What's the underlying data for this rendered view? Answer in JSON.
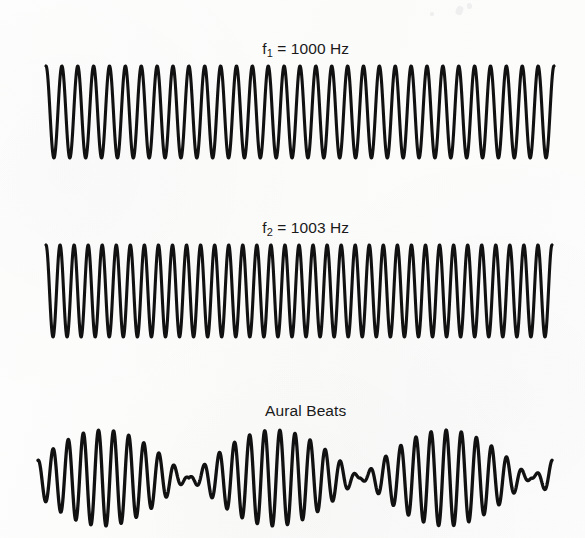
{
  "figure": {
    "title": "Aural Beats",
    "background_color": "#fcfcfb",
    "ink_color": "#111111",
    "width": 585,
    "height": 538
  },
  "panels": [
    {
      "id": "tone-1",
      "label_prefix": "f",
      "label_subscript": "1",
      "label_rest": " = 1000 Hz",
      "label_text": "f1 = 1000 Hz",
      "frequency_hz": 1000,
      "kind": "pure-tone"
    },
    {
      "id": "tone-2",
      "label_prefix": "f",
      "label_subscript": "2",
      "label_rest": " = 1003 Hz",
      "label_text": "f2 = 1003 Hz",
      "frequency_hz": 1003,
      "kind": "pure-tone"
    },
    {
      "id": "beats",
      "label_prefix": "",
      "label_subscript": "",
      "label_rest": "Aural Beats",
      "label_text": "Aural Beats",
      "frequency_hz": 3,
      "kind": "amplitude-modulated"
    }
  ],
  "chart_data": {
    "type": "line",
    "title": "Aural Beats",
    "xlabel": "",
    "ylabel": "",
    "grid": false,
    "legend": "none",
    "series": [
      {
        "name": "f1 = 1000 Hz",
        "waveform": "sine",
        "frequency_hz": 1000,
        "amplitude": 1.0,
        "cycles_drawn": 32,
        "phase_deg": 0,
        "x_start_px": 46,
        "x_end_px": 554,
        "baseline_y_px": 112,
        "peak_amplitude_px": 46,
        "stroke_width_px": 3.1
      },
      {
        "name": "f2 = 1003 Hz",
        "waveform": "sine",
        "frequency_hz": 1003,
        "amplitude": 1.0,
        "cycles_drawn": 36,
        "phase_deg": 0,
        "x_start_px": 46,
        "x_end_px": 552,
        "baseline_y_px": 291,
        "peak_amplitude_px": 46,
        "stroke_width_px": 3.1
      },
      {
        "name": "Aural Beats",
        "waveform": "sum-of-two-sines",
        "carrier_frequency_hz": 1001.5,
        "beat_frequency_hz": 3,
        "beats_drawn": 3,
        "carrier_cycles_drawn": 34,
        "x_start_px": 38,
        "x_end_px": 552,
        "baseline_y_px": 478,
        "peak_amplitude_px": 48,
        "stroke_width_px": 3.3,
        "envelope_nulls_px": [
          215,
          385
        ],
        "envelope_peaks_px": [
          128,
          298,
          470
        ]
      }
    ],
    "annotations": [
      "f1 = 1000 Hz",
      "f2 = 1003 Hz",
      "Aural Beats"
    ]
  }
}
